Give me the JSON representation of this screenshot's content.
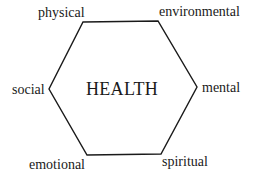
{
  "diagram": {
    "center": "HEALTH",
    "labels": {
      "physical": "physical",
      "environmental": "environmental",
      "social": "social",
      "mental": "mental",
      "emotional": "emotional",
      "spiritual": "spiritual"
    },
    "shape": "hexagon",
    "stroke_color": "#1a1a1a"
  }
}
